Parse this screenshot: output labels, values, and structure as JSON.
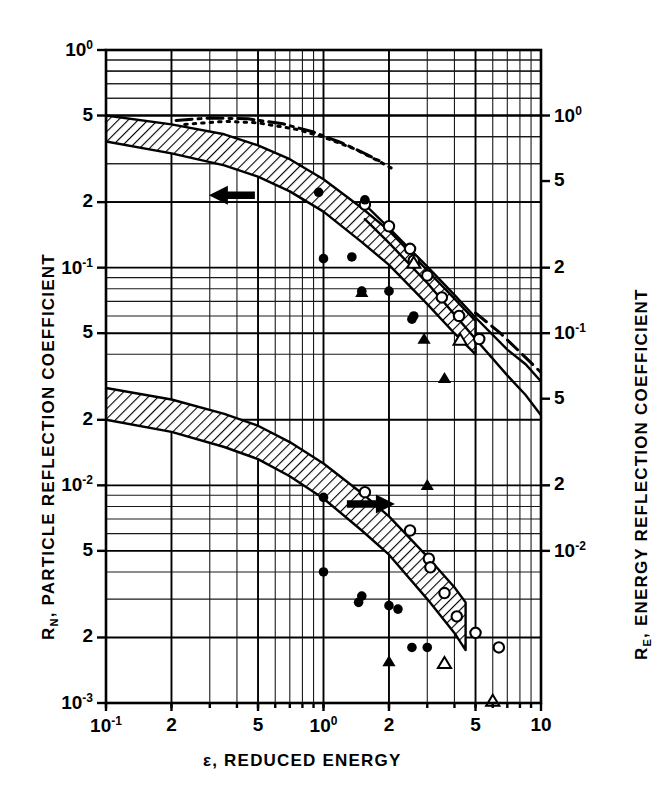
{
  "chart_data": {
    "type": "line",
    "title": "",
    "xlabel": "ε, REDUCED ENERGY",
    "ylabel_left": "R_N, PARTICLE REFLECTION COEFFICIENT",
    "ylabel_right": "R_E, ENERGY REFLECTION COEFFICIENT",
    "xscale": "log",
    "yscale": "log",
    "xlim": [
      0.1,
      10
    ],
    "ylim_left": [
      0.001,
      1.0
    ],
    "ylim_right": [
      0.01,
      2.0
    ],
    "grid": true,
    "legend": null,
    "xticks": [
      {
        "value": 0.1,
        "label": "10⁻¹"
      },
      {
        "value": 0.2,
        "label": "2"
      },
      {
        "value": 0.5,
        "label": "5"
      },
      {
        "value": 1.0,
        "label": "10⁰"
      },
      {
        "value": 2.0,
        "label": "2"
      },
      {
        "value": 5.0,
        "label": "5"
      },
      {
        "value": 10.0,
        "label": "10"
      }
    ],
    "yticks_left": [
      {
        "value": 1.0,
        "label": "10⁰"
      },
      {
        "value": 0.5,
        "label": "5"
      },
      {
        "value": 0.2,
        "label": "2"
      },
      {
        "value": 0.1,
        "label": "10⁻¹"
      },
      {
        "value": 0.05,
        "label": "5"
      },
      {
        "value": 0.02,
        "label": "2"
      },
      {
        "value": 0.01,
        "label": "10⁻²"
      },
      {
        "value": 0.005,
        "label": "5"
      },
      {
        "value": 0.002,
        "label": "2"
      },
      {
        "value": 0.001,
        "label": "10⁻³"
      }
    ],
    "yticks_right": [
      {
        "value": 1.0,
        "label": "10⁰"
      },
      {
        "value": 0.5,
        "label": "5"
      },
      {
        "value": 0.2,
        "label": "2"
      },
      {
        "value": 0.1,
        "label": "10⁻¹"
      },
      {
        "value": 0.05,
        "label": "5"
      },
      {
        "value": 0.02,
        "label": "2"
      },
      {
        "value": 0.01,
        "label": "10⁻²"
      }
    ],
    "annotations": [
      {
        "name": "left-arrow",
        "text": "←",
        "x": 0.31,
        "y": 0.215,
        "meaning": "upper band reads on left axis"
      },
      {
        "name": "right-arrow",
        "text": "→",
        "x": 1.55,
        "y": 0.0082,
        "meaning": "lower band reads on right axis"
      }
    ],
    "bands": [
      {
        "name": "particle-reflection-band",
        "style": "hatched",
        "upper": [
          [
            0.1,
            0.5
          ],
          [
            0.2,
            0.455
          ],
          [
            0.35,
            0.41
          ],
          [
            0.5,
            0.365
          ],
          [
            0.7,
            0.315
          ],
          [
            1.0,
            0.255
          ],
          [
            1.5,
            0.188
          ],
          [
            2.0,
            0.148
          ],
          [
            3.0,
            0.097
          ],
          [
            4.0,
            0.072
          ],
          [
            5.0,
            0.057
          ]
        ],
        "lower": [
          [
            0.1,
            0.38
          ],
          [
            0.2,
            0.335
          ],
          [
            0.35,
            0.295
          ],
          [
            0.5,
            0.262
          ],
          [
            0.7,
            0.224
          ],
          [
            1.0,
            0.181
          ],
          [
            1.5,
            0.131
          ],
          [
            2.0,
            0.103
          ],
          [
            3.0,
            0.068
          ],
          [
            4.0,
            0.05
          ],
          [
            5.0,
            0.04
          ]
        ]
      },
      {
        "name": "energy-reflection-band",
        "style": "hatched",
        "upper": [
          [
            0.1,
            0.028
          ],
          [
            0.2,
            0.0248
          ],
          [
            0.35,
            0.0213
          ],
          [
            0.5,
            0.0188
          ],
          [
            0.7,
            0.0158
          ],
          [
            1.0,
            0.0126
          ],
          [
            1.5,
            0.0092
          ],
          [
            2.0,
            0.0072
          ],
          [
            3.0,
            0.0047
          ],
          [
            4.0,
            0.0034
          ],
          [
            4.5,
            0.0029
          ]
        ],
        "lower": [
          [
            0.1,
            0.02
          ],
          [
            0.2,
            0.0176
          ],
          [
            0.35,
            0.015
          ],
          [
            0.5,
            0.0132
          ],
          [
            0.7,
            0.011
          ],
          [
            1.0,
            0.0087
          ],
          [
            1.5,
            0.0062
          ],
          [
            2.0,
            0.0048
          ],
          [
            3.0,
            0.003
          ],
          [
            4.0,
            0.0021
          ],
          [
            4.5,
            0.00175
          ]
        ]
      }
    ],
    "curves": [
      {
        "name": "dash-dot-upper",
        "style": "dashdot",
        "points": [
          [
            0.21,
            0.475
          ],
          [
            0.3,
            0.487
          ],
          [
            0.45,
            0.483
          ],
          [
            0.65,
            0.458
          ],
          [
            0.9,
            0.42
          ],
          [
            1.2,
            0.376
          ],
          [
            1.5,
            0.34
          ],
          [
            1.8,
            0.31
          ]
        ]
      },
      {
        "name": "dotted-upper",
        "style": "dotted",
        "points": [
          [
            0.23,
            0.455
          ],
          [
            0.35,
            0.47
          ],
          [
            0.5,
            0.463
          ],
          [
            0.75,
            0.432
          ],
          [
            1.0,
            0.398
          ],
          [
            1.4,
            0.35
          ],
          [
            1.8,
            0.308
          ],
          [
            2.1,
            0.283
          ]
        ]
      },
      {
        "name": "solid-outer",
        "style": "solid",
        "points": [
          [
            1.55,
            0.195
          ],
          [
            2.0,
            0.152
          ],
          [
            3.0,
            0.101
          ],
          [
            4.0,
            0.075
          ],
          [
            5.0,
            0.059
          ],
          [
            7.0,
            0.042
          ],
          [
            8.5,
            0.036
          ],
          [
            10.0,
            0.03
          ]
        ]
      },
      {
        "name": "solid-inner",
        "style": "solid",
        "points": [
          [
            1.55,
            0.167
          ],
          [
            2.0,
            0.13
          ],
          [
            3.0,
            0.085
          ],
          [
            4.0,
            0.061
          ],
          [
            5.0,
            0.047
          ],
          [
            7.0,
            0.032
          ],
          [
            8.5,
            0.026
          ],
          [
            10.0,
            0.021
          ]
        ]
      },
      {
        "name": "dashed-tail",
        "style": "dashed",
        "points": [
          [
            5.0,
            0.062
          ],
          [
            6.5,
            0.05
          ],
          [
            8.0,
            0.041
          ],
          [
            10.0,
            0.033
          ]
        ]
      }
    ],
    "series": [
      {
        "name": "open-circle",
        "marker": "open-circle",
        "points": [
          [
            1.55,
            0.195
          ],
          [
            2.0,
            0.155
          ],
          [
            2.5,
            0.122
          ],
          [
            2.6,
            0.108
          ],
          [
            3.0,
            0.092
          ],
          [
            3.5,
            0.073
          ],
          [
            4.2,
            0.06
          ],
          [
            5.2,
            0.047
          ],
          [
            1.55,
            0.0093
          ],
          [
            2.5,
            0.0062
          ],
          [
            3.05,
            0.0046
          ],
          [
            3.1,
            0.0042
          ],
          [
            3.6,
            0.0032
          ],
          [
            4.1,
            0.0025
          ],
          [
            5.0,
            0.0021
          ],
          [
            6.4,
            0.0018
          ]
        ]
      },
      {
        "name": "filled-circle",
        "marker": "filled-circle",
        "points": [
          [
            0.95,
            0.222
          ],
          [
            1.55,
            0.205
          ],
          [
            1.0,
            0.11
          ],
          [
            1.35,
            0.112
          ],
          [
            1.5,
            0.078
          ],
          [
            2.0,
            0.078
          ],
          [
            2.55,
            0.058
          ],
          [
            2.6,
            0.06
          ],
          [
            1.0,
            0.0088
          ],
          [
            1.0,
            0.004
          ],
          [
            1.45,
            0.0029
          ],
          [
            1.5,
            0.0031
          ],
          [
            2.0,
            0.0028
          ],
          [
            2.2,
            0.0027
          ],
          [
            2.55,
            0.0018
          ],
          [
            3.0,
            0.0018
          ]
        ]
      },
      {
        "name": "filled-triangle",
        "marker": "filled-triangle",
        "points": [
          [
            1.5,
            0.077
          ],
          [
            2.9,
            0.047
          ],
          [
            3.6,
            0.031
          ],
          [
            2.0,
            0.00155
          ],
          [
            3.0,
            0.01
          ]
        ]
      },
      {
        "name": "open-triangle",
        "marker": "open-triangle",
        "points": [
          [
            2.6,
            0.105
          ],
          [
            4.25,
            0.0465
          ],
          [
            3.6,
            0.00152
          ],
          [
            6.0,
            0.00102
          ]
        ]
      }
    ]
  },
  "axes": {
    "x_title": "ε, REDUCED ENERGY",
    "y_left_prefix": "R",
    "y_left_sub": "N",
    "y_left_rest": ", PARTICLE REFLECTION COEFFICIENT",
    "y_right_prefix": "R",
    "y_right_sub": "E",
    "y_right_rest": ", ENERGY REFLECTION COEFFICIENT"
  },
  "colors": {
    "ink": "#000000",
    "paper": "#ffffff",
    "grid": "#1a1a1a"
  }
}
